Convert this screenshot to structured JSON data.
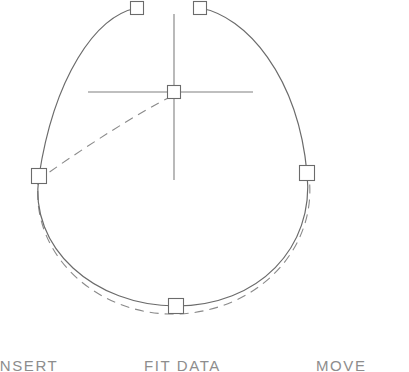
{
  "app": {
    "title": "Curve Editor",
    "canvas_background": "#ffffff",
    "line_color": "#6b6b6b",
    "handle_stroke": "#6b6b6b",
    "axis_color": "#808080",
    "dashed_color": "#8a8a8a",
    "menu_text_color": "#8d8d8d"
  },
  "menu": {
    "items": [
      {
        "label": "INSERT",
        "name": "menu-item-insert"
      },
      {
        "label": "FIT DATA",
        "name": "menu-item-fit-data"
      },
      {
        "label": "MOVE",
        "name": "menu-item-move"
      }
    ]
  },
  "canvas": {
    "width": 409,
    "height": 344,
    "axes": {
      "horizontal": {
        "x1": 88,
        "y1": 92,
        "x2": 253,
        "y2": 92
      },
      "vertical": {
        "x1": 174,
        "y1": 14,
        "x2": 174,
        "y2": 180
      }
    },
    "handles": [
      {
        "name": "control-handle-top-left",
        "x": 137,
        "y": 8,
        "size": 13,
        "label": "top-left"
      },
      {
        "name": "control-handle-top-right",
        "x": 200,
        "y": 8,
        "size": 13,
        "label": "top-right"
      },
      {
        "name": "control-handle-left",
        "x": 39,
        "y": 176,
        "size": 15,
        "label": "left"
      },
      {
        "name": "control-handle-right",
        "x": 307,
        "y": 173,
        "size": 15,
        "label": "right"
      },
      {
        "name": "control-handle-bottom",
        "x": 176,
        "y": 306,
        "size": 15,
        "label": "bottom"
      },
      {
        "name": "control-handle-center",
        "x": 174,
        "y": 92,
        "size": 13,
        "label": "center"
      }
    ],
    "solid_curve_path": "M 137 8 C 95 16 54 78 39 176 C 28 248 95 306 176 306 C 258 306 315 248 307 173 C 298 76 246 16 200 8",
    "dashed_curve_path": "M 39 176 C 27 254 98 316 176 314 C 256 312 318 250 309 176",
    "dashed_radius_path": "M 172 96 C 140 112 86 146 41 178",
    "curve_type": "closed-spline",
    "handle_count": 6
  }
}
